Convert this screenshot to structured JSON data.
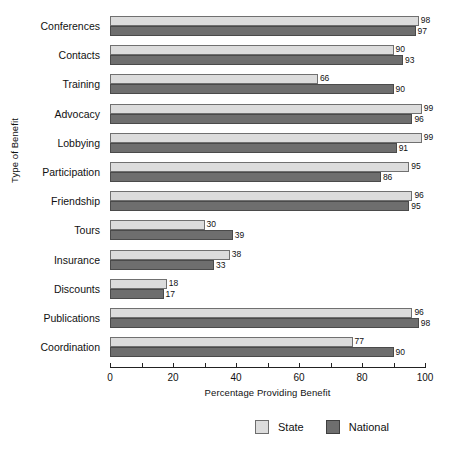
{
  "chart_data": {
    "type": "bar",
    "orientation": "horizontal",
    "title": "",
    "xlabel": "Percentage Providing Benefit",
    "ylabel": "Type of Benefit",
    "xlim": [
      0,
      100
    ],
    "xticks": [
      0,
      10,
      20,
      30,
      40,
      50,
      60,
      70,
      80,
      90,
      100
    ],
    "xtick_labels": [
      "0",
      "20",
      "40",
      "60",
      "80",
      "100"
    ],
    "xtick_label_values": [
      0,
      20,
      40,
      60,
      80,
      100
    ],
    "grid": false,
    "legend_position": "bottom-right",
    "categories": [
      "Conferences",
      "Contacts",
      "Training",
      "Advocacy",
      "Lobbying",
      "Participation",
      "Friendship",
      "Tours",
      "Insurance",
      "Discounts",
      "Publications",
      "Coordination"
    ],
    "series": [
      {
        "name": "State",
        "color": "#dcdcdc",
        "values": [
          98,
          90,
          66,
          99,
          99,
          95,
          96,
          30,
          38,
          18,
          96,
          77
        ]
      },
      {
        "name": "National",
        "color": "#6e6e6e",
        "values": [
          97,
          93,
          90,
          96,
          91,
          86,
          95,
          39,
          33,
          17,
          98,
          90
        ]
      }
    ]
  },
  "legend": {
    "items": [
      {
        "label": "State",
        "swatch": "state"
      },
      {
        "label": "National",
        "swatch": "national"
      }
    ]
  }
}
